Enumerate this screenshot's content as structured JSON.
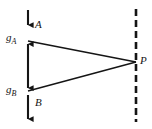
{
  "figure": {
    "type": "optics-ray-diagram",
    "background_color": "#ffffff",
    "stroke_color": "#151515",
    "labels": {
      "source_top": "A",
      "source_bottom": "B",
      "point_right": "P",
      "gap_top_base": "g",
      "gap_top_sub": "A",
      "gap_bottom_base": "g",
      "gap_bottom_sub": "B"
    },
    "elements": {
      "top_arrow": {
        "name": "object-arrow-A",
        "x": 28,
        "y_start": 10,
        "y_end": 28,
        "direction": "down"
      },
      "bottom_arrow": {
        "name": "object-arrow-B",
        "x": 28,
        "y_start": 95,
        "y_end": 122,
        "direction": "down"
      },
      "separation_bar": {
        "name": "separation-double-arrow",
        "x": 28,
        "y_start": 41,
        "y_end": 91,
        "direction": "double"
      },
      "ray_upper": {
        "name": "ray-from-A-to-P",
        "x1": 28,
        "y1": 41,
        "x2": 136,
        "y2": 62
      },
      "ray_lower": {
        "name": "ray-from-B-to-P",
        "x1": 28,
        "y1": 91,
        "x2": 136,
        "y2": 62
      },
      "screen_line": {
        "name": "dashed-screen-line",
        "x": 136,
        "y_start": 9,
        "y_end": 122,
        "dash": "7,4"
      },
      "point_P": {
        "name": "point-P",
        "x": 136,
        "y": 62
      }
    }
  }
}
